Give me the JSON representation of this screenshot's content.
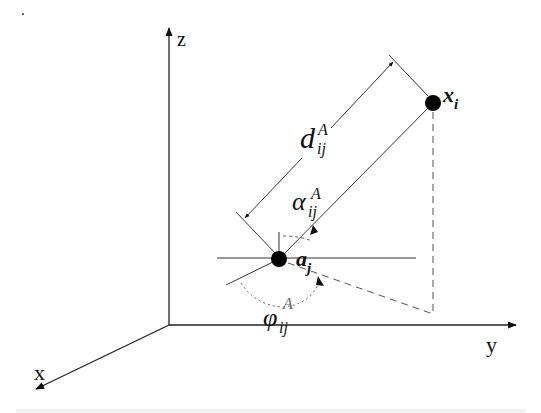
{
  "diagram": {
    "type": "3d-coordinate-geometry",
    "axes": {
      "z": {
        "label": "z"
      },
      "y": {
        "label": "y"
      },
      "x": {
        "label": "x"
      }
    },
    "points": {
      "anchor": {
        "symbol": "a",
        "subscript": "j"
      },
      "target": {
        "symbol": "x",
        "subscript": "i"
      }
    },
    "quantities": {
      "distance": {
        "symbol": "d",
        "subscript": "ij",
        "superscript": "A"
      },
      "elevation_angle": {
        "symbol": "α",
        "subscript": "ij",
        "superscript": "A"
      },
      "azimuth_angle": {
        "symbol": "φ",
        "subscript": "ij",
        "superscript": "A"
      }
    },
    "colors": {
      "line": "#222222",
      "dashed": "#555555",
      "background": "#ffffff"
    }
  }
}
